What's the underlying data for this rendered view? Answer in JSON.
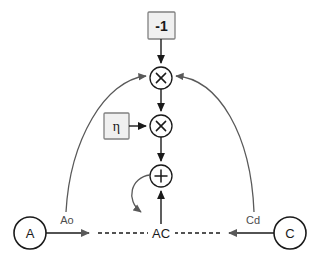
{
  "diagram": {
    "background_color": "#ffffff",
    "nodes": {
      "const_neg_one": {
        "label": "-1",
        "shape": "box",
        "fill": "#f0f0f0",
        "stroke": "#808080",
        "x": 161,
        "y": 25
      },
      "eta": {
        "label": "η",
        "shape": "box",
        "fill": "#f0f0f0",
        "stroke": "#808080",
        "x": 116,
        "y": 126
      },
      "mul_top": {
        "label": "×",
        "shape": "circle",
        "x": 161,
        "y": 78
      },
      "mul_mid": {
        "label": "×",
        "shape": "circle",
        "x": 161,
        "y": 126
      },
      "plus": {
        "label": "+",
        "shape": "circle",
        "x": 161,
        "y": 176
      },
      "var_a": {
        "label": "A",
        "shape": "circle",
        "x": 30,
        "y": 233
      },
      "var_c": {
        "label": "C",
        "shape": "circle",
        "x": 290,
        "y": 233
      },
      "var_ac": {
        "label": "AC",
        "shape": "text",
        "x": 161,
        "y": 233
      }
    },
    "edge_labels": {
      "ao": {
        "label": "Ao",
        "x": 67,
        "y": 220,
        "color": "#4d4d4d"
      },
      "cd": {
        "label": "Cd",
        "x": 253,
        "y": 220,
        "color": "#4d4d4d"
      }
    },
    "edges": [
      {
        "name": "const-to-mul-top",
        "from": "const_neg_one",
        "to": "mul_top",
        "style": "solid",
        "arrow": true
      },
      {
        "name": "mul-top-to-mul-mid",
        "from": "mul_top",
        "to": "mul_mid",
        "style": "solid",
        "arrow": true
      },
      {
        "name": "eta-to-mul-mid",
        "from": "eta",
        "to": "mul_mid",
        "style": "solid",
        "arrow": true
      },
      {
        "name": "mul-mid-to-plus",
        "from": "mul_mid",
        "to": "plus",
        "style": "solid",
        "arrow": true
      },
      {
        "name": "ac-to-plus",
        "from": "var_ac",
        "to": "plus",
        "style": "solid",
        "arrow": true
      },
      {
        "name": "a-to-ac",
        "from": "var_a",
        "to": "var_ac",
        "style": "solid-then-dashed",
        "arrow": true,
        "label": "Ao"
      },
      {
        "name": "c-to-ac",
        "from": "var_c",
        "to": "var_ac",
        "style": "solid-then-dashed",
        "arrow": true,
        "label": "Cd"
      },
      {
        "name": "a-arc-to-mul-top",
        "from": "var_a",
        "to": "mul_top",
        "style": "arc",
        "arrow": true
      },
      {
        "name": "c-arc-to-mul-top",
        "from": "var_c",
        "to": "mul_top",
        "style": "arc",
        "arrow": true
      },
      {
        "name": "plus-self-loop-to-ac",
        "from": "plus",
        "to": "var_ac",
        "style": "arc",
        "arrow": true
      }
    ],
    "colors": {
      "stroke_dark": "#1a1a1a",
      "stroke_arc": "#595959",
      "box_fill": "#f0f0f0",
      "box_stroke": "#808080",
      "label_gray": "#4d4d4d"
    }
  }
}
